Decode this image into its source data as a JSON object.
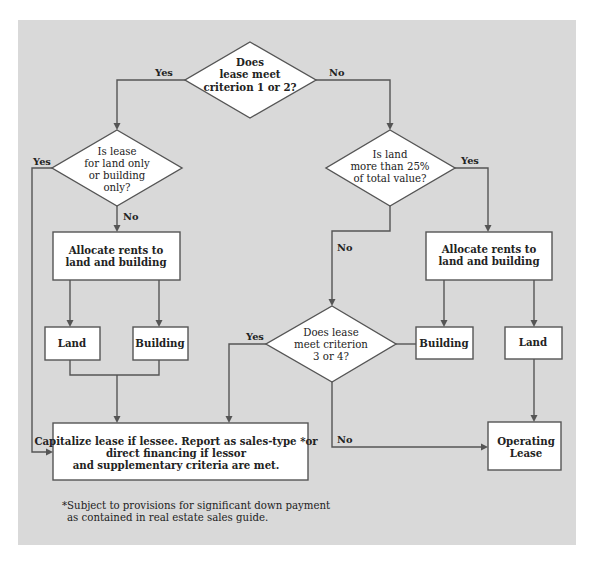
{
  "diagram": {
    "type": "flowchart",
    "colors": {
      "background": "#d9d9d9",
      "node_fill": "#ffffff",
      "stroke": "#555555",
      "text": "#222222"
    },
    "nodes": {
      "d1": {
        "kind": "decision",
        "lines": [
          "Does",
          "lease meet",
          "criterion 1 or 2?"
        ]
      },
      "d2": {
        "kind": "decision",
        "lines": [
          "Is lease",
          "for land only",
          "or building",
          "only?"
        ]
      },
      "d3": {
        "kind": "decision",
        "lines": [
          "Is land",
          "more than 25%",
          "of total value?"
        ]
      },
      "d4": {
        "kind": "decision",
        "lines": [
          "Does lease",
          "meet criterion",
          "3 or 4?"
        ]
      },
      "alloc_left": {
        "kind": "process",
        "lines": [
          "Allocate rents to",
          "land and building"
        ]
      },
      "alloc_right": {
        "kind": "process",
        "lines": [
          "Allocate rents to",
          "land and building"
        ]
      },
      "land_left": {
        "kind": "process",
        "lines": [
          "Land"
        ]
      },
      "building_left": {
        "kind": "process",
        "lines": [
          "Building"
        ]
      },
      "building_right": {
        "kind": "process",
        "lines": [
          "Building"
        ]
      },
      "land_right": {
        "kind": "process",
        "lines": [
          "Land"
        ]
      },
      "capitalize": {
        "kind": "terminal",
        "lines": [
          "Capitalize lease if lessee. Report as sales-type *or",
          "direct financing if lessor",
          "and supplementary criteria are met."
        ]
      },
      "operating": {
        "kind": "terminal",
        "lines": [
          "Operating",
          "Lease"
        ]
      }
    },
    "edges": [
      {
        "from": "d1",
        "to": "d2",
        "label": "Yes"
      },
      {
        "from": "d1",
        "to": "d3",
        "label": "No"
      },
      {
        "from": "d2",
        "to": "capitalize",
        "label": "Yes"
      },
      {
        "from": "d2",
        "to": "alloc_left",
        "label": "No"
      },
      {
        "from": "d3",
        "to": "alloc_right",
        "label": "Yes"
      },
      {
        "from": "d3",
        "to": "d4",
        "label": "No"
      },
      {
        "from": "alloc_left",
        "to": "land_left",
        "label": ""
      },
      {
        "from": "alloc_left",
        "to": "building_left",
        "label": ""
      },
      {
        "from": "land_left",
        "to": "capitalize",
        "label": ""
      },
      {
        "from": "building_left",
        "to": "capitalize",
        "label": ""
      },
      {
        "from": "alloc_right",
        "to": "building_right",
        "label": ""
      },
      {
        "from": "alloc_right",
        "to": "land_right",
        "label": ""
      },
      {
        "from": "building_right",
        "to": "d4",
        "label": ""
      },
      {
        "from": "d4",
        "to": "capitalize",
        "label": "Yes"
      },
      {
        "from": "d4",
        "to": "operating",
        "label": "No"
      },
      {
        "from": "land_right",
        "to": "operating",
        "label": ""
      }
    ],
    "labels": {
      "yes": "Yes",
      "no": "No"
    },
    "footnote": [
      "*Subject to provisions for significant down payment",
      "as contained in real estate sales guide."
    ]
  }
}
